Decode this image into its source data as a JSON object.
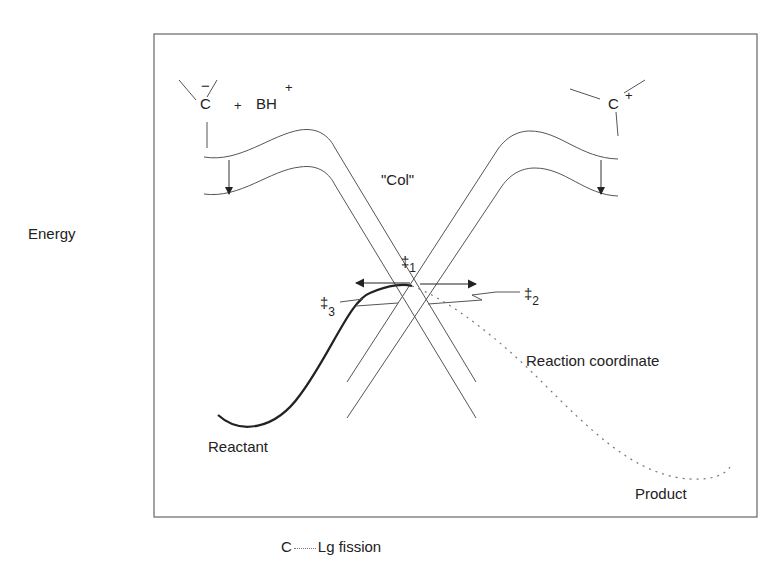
{
  "page": {
    "header_fragment": "20 · Kinetics (cut off)"
  },
  "diagram": {
    "type": "energy-surface / More O'Ferrall–Jencks style diagram",
    "y_axis_label": "Energy",
    "x_axis_label": "C----Lg  fission",
    "x_axis_parts": {
      "left": "C",
      "right": "Lg  fission"
    },
    "left_species": {
      "atom": "C",
      "charge": "−",
      "plus": "+",
      "partner": "BH",
      "partner_charge": "+"
    },
    "right_species": {
      "atom": "C",
      "charge": "+"
    },
    "collision_label": "\"Col\"",
    "transition_states": [
      {
        "symbol": "‡",
        "subscript": "1"
      },
      {
        "symbol": "‡",
        "subscript": "2"
      },
      {
        "symbol": "‡",
        "subscript": "3"
      }
    ],
    "labels": {
      "reactant": "Reactant",
      "product": "Product",
      "reaction_coordinate": "Reaction coordinate"
    },
    "colors": {
      "line": "#555555",
      "curve": "#222222",
      "frame": "#666666"
    }
  }
}
